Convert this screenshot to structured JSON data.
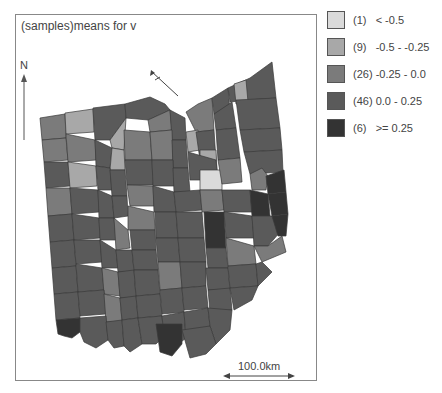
{
  "title": "(samples)means for v",
  "north_arrow": {
    "label": "N",
    "icon": "north-arrow-icon"
  },
  "scale_bar": {
    "label": "100.0km"
  },
  "legend": {
    "items": [
      {
        "count_label": "(1)",
        "range_label": "< -0.5",
        "color": "#dadada"
      },
      {
        "count_label": "(9)",
        "range_label": "-0.5 - -0.25",
        "color": "#a8a8a8"
      },
      {
        "count_label": "(26)",
        "range_label": "-0.25 - 0.0",
        "color": "#7b7b7b"
      },
      {
        "count_label": "(46)",
        "range_label": "0.0 - 0.25",
        "color": "#5a5a5a"
      },
      {
        "count_label": "(6)",
        "range_label": ">= 0.25",
        "color": "#333333"
      }
    ]
  },
  "map": {
    "region": "Ohio counties",
    "class_counts": [
      1,
      9,
      26,
      46,
      6
    ]
  }
}
